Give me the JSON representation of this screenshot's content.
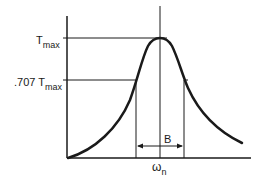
{
  "diagram": {
    "type": "resonance-curve",
    "labels": {
      "tmax_main": "T",
      "tmax_sub": "max",
      "t707_prefix": ".707 T",
      "t707_sub": "max",
      "bandwidth": "B",
      "omega_main": "ω",
      "omega_sub": "n"
    },
    "colors": {
      "ink": "#1a1a1a",
      "background": "#ffffff"
    }
  }
}
